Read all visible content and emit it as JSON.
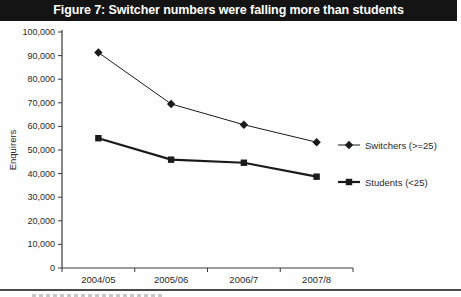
{
  "title": "Figure 7: Switcher numbers were falling more than students",
  "colors": {
    "title_bg": "#141414",
    "title_fg": "#ffffff",
    "axis": "#3a3a3a",
    "line": "#1a1a1a",
    "background": "#fefefe",
    "footer_rule": "#4a4a4a"
  },
  "chart_data": {
    "type": "line",
    "title": "Figure 7: Switcher numbers were falling more than students",
    "categories": [
      "2004/05",
      "2005/06",
      "2006/7",
      "2007/8"
    ],
    "series": [
      {
        "name": "Switchers (>=25)",
        "marker": "diamond",
        "line_width": 1,
        "values": [
          91300,
          69500,
          60700,
          53300
        ]
      },
      {
        "name": "Students (<25)",
        "marker": "square",
        "line_width": 2.2,
        "values": [
          55000,
          45900,
          44600,
          38700
        ]
      }
    ],
    "xlabel": "",
    "ylabel": "Enquirers",
    "ylim": [
      0,
      100000
    ],
    "ytick_step": 10000,
    "ytick_labels": [
      "0",
      "10,000",
      "20,000",
      "30,000",
      "40,000",
      "50,000",
      "60,000",
      "70,000",
      "80,000",
      "90,000",
      "100,000"
    ],
    "grid": false,
    "legend_position": "right"
  }
}
